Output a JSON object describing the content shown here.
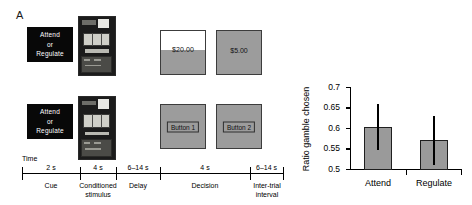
{
  "panels": {
    "a_letter": "A",
    "b_letter": "B"
  },
  "panel_a": {
    "cue": {
      "line1": "Attend",
      "line2": "or",
      "line3": "Regulate"
    },
    "stimulus_icon": "slot-machine-photo",
    "row1": {
      "gamble_option": {
        "amount": "$20.00"
      },
      "safe_option": {
        "amount": "$5.00"
      }
    },
    "row2": {
      "button_left": "Button 1",
      "button_right": "Button 2"
    },
    "timeline": {
      "axis_label": "Time",
      "segments": [
        {
          "duration": "2 s",
          "phase_line1": "Cue",
          "phase_line2": ""
        },
        {
          "duration": "4 s",
          "phase_line1": "Conditioned",
          "phase_line2": "stimulus"
        },
        {
          "duration": "6–14 s",
          "phase_line1": "Delay",
          "phase_line2": ""
        },
        {
          "duration": "4 s",
          "phase_line1": "Decision",
          "phase_line2": ""
        },
        {
          "duration": "6–14 s",
          "phase_line1": "Inter-trial",
          "phase_line2": "interval"
        }
      ]
    }
  },
  "chart_data": {
    "type": "bar",
    "title": "",
    "xlabel": "",
    "ylabel": "Ratio gamble chosen",
    "categories": [
      "Attend",
      "Regulate"
    ],
    "values": [
      0.605,
      0.572
    ],
    "errors_low": [
      0.55,
      0.513
    ],
    "errors_high": [
      0.66,
      0.632
    ],
    "ylim": [
      0.5,
      0.7
    ],
    "yticks": [
      0.5,
      0.55,
      0.6,
      0.65,
      0.7
    ],
    "ytick_labels": [
      "0.5",
      "0.55",
      "0.6",
      "0.65",
      "0.7"
    ],
    "grid": false,
    "legend": "none",
    "bar_color": "#9a9a9a",
    "bar_edge_color": "#1f1f1f"
  }
}
